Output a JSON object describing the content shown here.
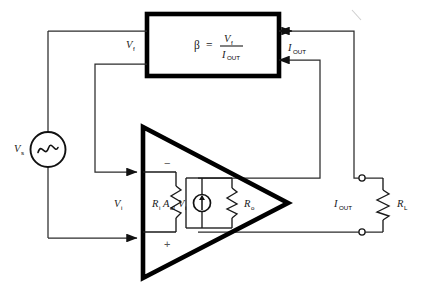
{
  "figure": {
    "type": "circuit-diagram",
    "background_color": "#ffffff",
    "line_color": "#2b2b2b",
    "block_color": "#000000"
  },
  "feedback_block": {
    "name": "beta-network",
    "formula_beta": "β",
    "formula_equals": "=",
    "formula_numerator": "V",
    "formula_numerator_sub": "f",
    "formula_denominator": "I",
    "formula_denominator_sub": "OUT"
  },
  "labels": {
    "source": "V",
    "source_sub": "s",
    "feedback_voltage": "V",
    "feedback_voltage_sub": "f",
    "input_voltage": "V",
    "input_voltage_sub": "i",
    "input_resistance": "R",
    "input_resistance_sub": "i",
    "gain_symbol": "A",
    "gain_sub": "ol",
    "gain_times_voltage": "V",
    "gain_times_voltage_sub": "i",
    "output_resistance": "R",
    "output_resistance_sub": "o",
    "output_current": "I",
    "output_current_sub": "OUT",
    "output_current_block": "I",
    "output_current_block_sub": "OUT",
    "load_resistance": "R",
    "load_resistance_sub": "L",
    "inverting_sign": "−",
    "noninverting_sign": "+"
  },
  "components": {
    "source_symbol": "sine-wave-source",
    "dependent_source_symbol": "dependent-current-source",
    "resistor_symbol": "zigzag-resistor",
    "amplifier_symbol": "triangle-amplifier",
    "terminal_symbol": "open-circle-terminal"
  }
}
